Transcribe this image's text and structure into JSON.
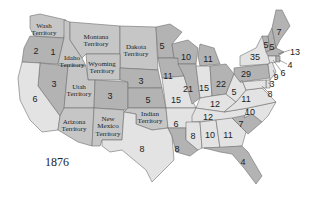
{
  "year_label": "1876",
  "colors": {
    "republican": "#b3b3b3",
    "democratic": "#e3e3e3",
    "territory": "#c6c6c6",
    "border": "#6f6f6f"
  },
  "territories": [
    {
      "name": "Wash Territory",
      "line1": "Wash",
      "line2": "Territory"
    },
    {
      "name": "Montana Territory",
      "line1": "Montana",
      "line2": "Territory"
    },
    {
      "name": "Dakota Territory",
      "line1": "Dakota",
      "line2": "Territory"
    },
    {
      "name": "Idaho Territory",
      "line1": "Idaho",
      "line2": "Territory"
    },
    {
      "name": "Wyoming Territory",
      "line1": "Wyoming",
      "line2": "Territory"
    },
    {
      "name": "Utah Territory",
      "line1": "Utah",
      "line2": "Territory"
    },
    {
      "name": "Arizona Territory",
      "line1": "Arizona",
      "line2": "Territory"
    },
    {
      "name": "New Mexico Territory",
      "line1": "New",
      "line2": "Mexico",
      "line3": "Territory"
    },
    {
      "name": "Indian Territory",
      "line1": "Indian",
      "line2": "Territory"
    }
  ],
  "states": {
    "oregon": "2",
    "california": "6",
    "nevada": "3",
    "colorado": "3",
    "nebraska": "3",
    "kansas": "5",
    "texas": "8",
    "minnesota": "5",
    "iowa": "11",
    "missouri": "15",
    "arkansas": "6",
    "louisiana": "8",
    "wisconsin": "10",
    "illinois": "21",
    "michigan": "11",
    "indiana": "15",
    "ohio": "22",
    "kentucky": "12",
    "tennessee": "12",
    "mississippi": "8",
    "alabama": "10",
    "georgia": "11",
    "florida": "4",
    "south_carolina": "7",
    "north_carolina": "10",
    "virginia": "11",
    "west_virginia": "5",
    "pennsylvania": "29",
    "new_york": "35",
    "vermont": "5",
    "new_hampshire": "5",
    "maine": "7",
    "massachusetts": "13",
    "rhode_island": "4",
    "connecticut": "6",
    "new_jersey": "9",
    "delaware": "3",
    "maryland": "8",
    "idaho_extra": "1"
  }
}
